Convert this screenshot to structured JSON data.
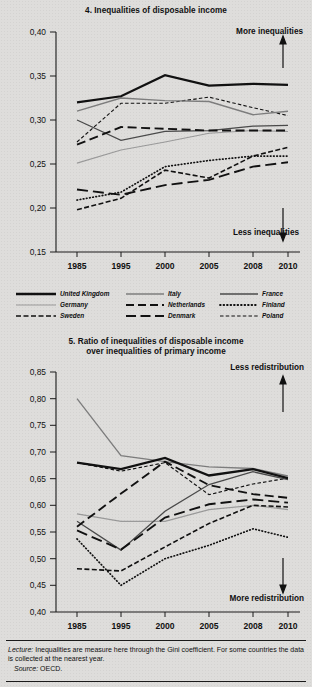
{
  "figure": {
    "footer": {
      "lecture_label": "Lecture:",
      "lecture_text": " Inequalities are measure here through the Gini coefficient. For some countries the data is collected at the nearest year.",
      "source_label": "Source:",
      "source_text": " OECD."
    },
    "legend": {
      "items": [
        {
          "name": "United Kingdom",
          "style": "solid-thick-black",
          "color": "#111111"
        },
        {
          "name": "Italy",
          "style": "solid-thin-gray",
          "color": "#7a7a7a"
        },
        {
          "name": "France",
          "style": "solid-medium-dark",
          "color": "#3a3a3a"
        },
        {
          "name": "Germany",
          "style": "solid-thin-light",
          "color": "#9a9a9a"
        },
        {
          "name": "Netherlands",
          "style": "dash-long",
          "color": "#111111"
        },
        {
          "name": "Finland",
          "style": "dotted",
          "color": "#111111"
        },
        {
          "name": "Sweden",
          "style": "dash-dot",
          "color": "#111111"
        },
        {
          "name": "Denmark",
          "style": "dash-long-thick",
          "color": "#111111"
        },
        {
          "name": "Poland",
          "style": "dash-short",
          "color": "#111111"
        }
      ]
    }
  },
  "chart_data": [
    {
      "id": "chart-4",
      "type": "line",
      "title": "4. Inequalities of disposable income",
      "xlabel": "",
      "ylabel": "",
      "x": [
        "1985",
        "1995",
        "2000",
        "2005",
        "2008",
        "2010"
      ],
      "xticklabels": [
        "1985",
        "1995",
        "2000",
        "2005",
        "2008",
        "2010"
      ],
      "yticklabels": [
        "0,15",
        "0,20",
        "0,25",
        "0,30",
        "0,35",
        "0,40"
      ],
      "ylim": [
        0.15,
        0.4
      ],
      "ytick_step": 0.05,
      "grid": false,
      "legend_position": "below",
      "annotations": [
        {
          "text": "More inequalities",
          "position": "top-right",
          "arrow": "up"
        },
        {
          "text": "Less inequalities",
          "position": "bottom-right",
          "arrow": "down"
        }
      ],
      "series": [
        {
          "name": "United Kingdom",
          "values": [
            0.32,
            0.327,
            0.351,
            0.339,
            0.341,
            0.34
          ]
        },
        {
          "name": "Italy",
          "values": [
            0.31,
            0.325,
            0.322,
            0.321,
            0.306,
            0.31
          ]
        },
        {
          "name": "France",
          "values": [
            0.3,
            0.277,
            0.287,
            0.288,
            0.293,
            0.294
          ]
        },
        {
          "name": "Germany",
          "values": [
            0.251,
            0.266,
            0.275,
            0.285,
            0.288,
            0.287
          ]
        },
        {
          "name": "Netherlands",
          "values": [
            0.272,
            0.292,
            0.29,
            0.288,
            0.288,
            0.288
          ]
        },
        {
          "name": "Finland",
          "values": [
            0.209,
            0.218,
            0.247,
            0.254,
            0.259,
            0.259
          ]
        },
        {
          "name": "Sweden",
          "values": [
            0.198,
            0.211,
            0.243,
            0.234,
            0.259,
            0.269
          ]
        },
        {
          "name": "Denmark",
          "values": [
            0.221,
            0.215,
            0.226,
            0.232,
            0.247,
            0.252
          ]
        },
        {
          "name": "Poland",
          "values": [
            0.275,
            0.319,
            0.319,
            0.326,
            0.314,
            0.305
          ]
        }
      ]
    },
    {
      "id": "chart-5",
      "type": "line",
      "title_line1": "5. Ratio of inequalities of disposable income",
      "title_line2": "over inequalities of primary income",
      "title": "5. Ratio of inequalities of disposable income over inequalities of primary income",
      "xlabel": "",
      "ylabel": "",
      "x": [
        "1985",
        "1995",
        "2000",
        "2005",
        "2008",
        "2010"
      ],
      "xticklabels": [
        "1985",
        "1995",
        "2000",
        "2005",
        "2008",
        "2010"
      ],
      "yticklabels": [
        "0,40",
        "0,45",
        "0,50",
        "0,55",
        "0,60",
        "0,65",
        "0,70",
        "0,75",
        "0,80",
        "0,85"
      ],
      "ylim": [
        0.4,
        0.85
      ],
      "ytick_step": 0.05,
      "grid": false,
      "legend_position": "shared-above",
      "annotations": [
        {
          "text": "Less redistribution",
          "position": "top-right",
          "arrow": "up"
        },
        {
          "text": "More redistribution",
          "position": "bottom-right",
          "arrow": "down"
        }
      ],
      "series": [
        {
          "name": "United Kingdom",
          "values": [
            0.68,
            0.668,
            0.689,
            0.656,
            0.668,
            0.651
          ]
        },
        {
          "name": "Italy",
          "values": [
            0.8,
            0.693,
            0.682,
            0.672,
            0.669,
            0.655
          ]
        },
        {
          "name": "France",
          "values": [
            0.57,
            0.516,
            0.589,
            0.639,
            0.663,
            0.648
          ]
        },
        {
          "name": "Germany",
          "values": [
            0.584,
            0.57,
            0.57,
            0.592,
            0.6,
            0.592
          ]
        },
        {
          "name": "Netherlands",
          "values": [
            0.56,
            0.622,
            0.682,
            0.638,
            0.621,
            0.614
          ]
        },
        {
          "name": "Finland",
          "values": [
            0.537,
            0.45,
            0.5,
            0.525,
            0.556,
            0.54
          ]
        },
        {
          "name": "Sweden",
          "values": [
            0.481,
            0.477,
            0.522,
            0.566,
            0.6,
            0.597
          ]
        },
        {
          "name": "Denmark",
          "values": [
            0.553,
            0.517,
            0.577,
            0.602,
            0.611,
            0.605
          ]
        },
        {
          "name": "Poland",
          "values": [
            0.68,
            0.664,
            0.68,
            0.62,
            0.64,
            0.651
          ]
        }
      ]
    }
  ]
}
